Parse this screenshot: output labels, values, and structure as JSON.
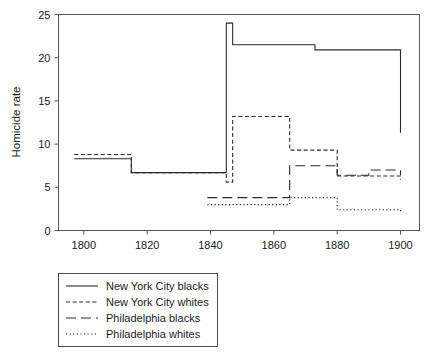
{
  "chart_data": {
    "type": "line",
    "title": "",
    "subtitle": "",
    "xlabel": "",
    "ylabel": "Homicide rate",
    "xlim": [
      1792,
      1906
    ],
    "ylim": [
      0,
      25
    ],
    "xticks": [
      1800,
      1820,
      1840,
      1860,
      1880,
      1900
    ],
    "yticks": [
      0,
      5,
      10,
      15,
      20,
      25
    ],
    "grid": false,
    "step_style": "post",
    "legend_position": "below-left",
    "series": [
      {
        "name": "New York City blacks",
        "style": "solid",
        "x": [
          1797,
          1807,
          1815,
          1843,
          1845,
          1847,
          1865,
          1873,
          1900
        ],
        "values": [
          8.3,
          8.3,
          6.7,
          6.7,
          24.0,
          21.5,
          21.5,
          20.9,
          11.3
        ]
      },
      {
        "name": "New York City whites",
        "style": "dashed",
        "x": [
          1797,
          1807,
          1815,
          1843,
          1845,
          1847,
          1865,
          1880,
          1900
        ],
        "values": [
          8.8,
          8.8,
          6.7,
          6.7,
          5.6,
          13.2,
          9.3,
          6.3,
          5.9
        ]
      },
      {
        "name": "Philadelphia blacks",
        "style": "longdash",
        "x": [
          1839,
          1847,
          1865,
          1880,
          1890,
          1900
        ],
        "values": [
          3.8,
          3.8,
          7.5,
          6.4,
          7.0,
          6.4
        ]
      },
      {
        "name": "Philadelphia whites",
        "style": "dotted",
        "x": [
          1839,
          1847,
          1865,
          1880,
          1900
        ],
        "values": [
          3.0,
          3.0,
          3.8,
          2.4,
          2.0
        ]
      }
    ]
  },
  "axes": {
    "ylabel": "Homicide rate",
    "xtick_labels": [
      "1800",
      "1820",
      "1840",
      "1860",
      "1880",
      "1900"
    ],
    "ytick_labels": [
      "0",
      "5",
      "10",
      "15",
      "20",
      "25"
    ]
  },
  "legend": {
    "items": [
      {
        "label": "New York City blacks",
        "key": "solid-line-key"
      },
      {
        "label": "New York City whites",
        "key": "dashed-line-key"
      },
      {
        "label": "Philadelphia blacks",
        "key": "longdash-line-key"
      },
      {
        "label": "Philadelphia whites",
        "key": "dotted-line-key"
      }
    ]
  },
  "colors": {
    "line": "#2b2b2b",
    "axis": "#555555",
    "text": "#1a1a1a",
    "background": "#ffffff"
  }
}
